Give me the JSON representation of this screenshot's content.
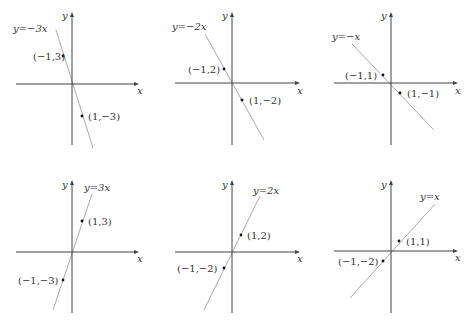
{
  "chart_data": [
    {
      "type": "line",
      "title": "y=-3x",
      "equation": "y=−3x",
      "slope": -3,
      "xlabel": "x",
      "ylabel": "y",
      "points": [
        {
          "x": -1,
          "y": 3,
          "label": "(−1,3)"
        },
        {
          "x": 1,
          "y": -3,
          "label": "(1,−3)"
        }
      ],
      "grid": false
    },
    {
      "type": "line",
      "title": "y=-2x",
      "equation": "y=−2x",
      "slope": -2,
      "xlabel": "x",
      "ylabel": "y",
      "points": [
        {
          "x": -1,
          "y": 2,
          "label": "(−1,2)"
        },
        {
          "x": 1,
          "y": -2,
          "label": "(1,−2)"
        }
      ],
      "grid": false
    },
    {
      "type": "line",
      "title": "y=-x",
      "equation": "y=−x",
      "slope": -1,
      "xlabel": "x",
      "ylabel": "y",
      "points": [
        {
          "x": -1,
          "y": 1,
          "label": "(−1,1)"
        },
        {
          "x": 1,
          "y": -1,
          "label": "(1,−1)"
        }
      ],
      "grid": false
    },
    {
      "type": "line",
      "title": "y=3x",
      "equation": "y=3x",
      "slope": 3,
      "xlabel": "x",
      "ylabel": "y",
      "points": [
        {
          "x": 1,
          "y": 3,
          "label": "(1,3)"
        },
        {
          "x": -1,
          "y": -3,
          "label": "(−1,−3)"
        }
      ],
      "grid": false
    },
    {
      "type": "line",
      "title": "y=2x",
      "equation": "y=2x",
      "slope": 2,
      "xlabel": "x",
      "ylabel": "y",
      "points": [
        {
          "x": 1,
          "y": 2,
          "label": "(1,2)"
        },
        {
          "x": -1,
          "y": -2,
          "label": "(−1,−2)"
        }
      ],
      "grid": false
    },
    {
      "type": "line",
      "title": "y=x",
      "equation": "y=x",
      "slope": 1,
      "xlabel": "x",
      "ylabel": "y",
      "points": [
        {
          "x": 1,
          "y": 1,
          "label": "(1,1)"
        },
        {
          "x": -1,
          "y": -2,
          "label": "(−1,−2)"
        }
      ],
      "grid": false
    }
  ],
  "layout": [
    {
      "ox": 72,
      "oy": 84,
      "xmin": 16,
      "xmax": 139,
      "ymin": 12,
      "ymax": 145,
      "line": [
        [
          56,
          30
        ],
        [
          93,
          148
        ]
      ],
      "eq_pos": [
        13,
        32
      ],
      "ylbl_pos": [
        62,
        19
      ],
      "xlbl_pos": [
        137,
        94
      ],
      "pts": [
        [
          63,
          56,
          33,
          60
        ],
        [
          82,
          116,
          88,
          120
        ]
      ]
    },
    {
      "ox": 232,
      "oy": 83,
      "xmin": 175,
      "xmax": 300,
      "ymin": 12,
      "ymax": 145,
      "line": [
        [
          205,
          34
        ],
        [
          264,
          140
        ]
      ],
      "eq_pos": [
        172,
        30
      ],
      "ylbl_pos": [
        222,
        19
      ],
      "xlbl_pos": [
        297,
        94
      ],
      "pts": [
        [
          224,
          69,
          188,
          73
        ],
        [
          242,
          100,
          249,
          104
        ]
      ]
    },
    {
      "ox": 391,
      "oy": 83,
      "xmin": 334,
      "xmax": 458,
      "ymin": 12,
      "ymax": 145,
      "line": [
        [
          352,
          44
        ],
        [
          434,
          130
        ]
      ],
      "eq_pos": [
        332,
        40
      ],
      "ylbl_pos": [
        381,
        19
      ],
      "xlbl_pos": [
        455,
        94
      ],
      "pts": [
        [
          383,
          75,
          345,
          79
        ],
        [
          400,
          93,
          407,
          97
        ]
      ]
    },
    {
      "ox": 72,
      "oy": 252,
      "xmin": 16,
      "xmax": 139,
      "ymin": 180,
      "ymax": 313,
      "line": [
        [
          53,
          310
        ],
        [
          92,
          194
        ]
      ],
      "eq_pos": [
        84,
        191
      ],
      "ylbl_pos": [
        62,
        188
      ],
      "xlbl_pos": [
        137,
        262
      ],
      "pts": [
        [
          82,
          221,
          88,
          225
        ],
        [
          63,
          280,
          18,
          284
        ]
      ]
    },
    {
      "ox": 232,
      "oy": 252,
      "xmin": 175,
      "xmax": 300,
      "ymin": 180,
      "ymax": 313,
      "line": [
        [
          204,
          310
        ],
        [
          260,
          196
        ]
      ],
      "eq_pos": [
        253,
        194
      ],
      "ylbl_pos": [
        222,
        188
      ],
      "xlbl_pos": [
        297,
        262
      ],
      "pts": [
        [
          241,
          235,
          247,
          239
        ],
        [
          224,
          268,
          177,
          272
        ]
      ]
    },
    {
      "ox": 391,
      "oy": 251,
      "xmin": 334,
      "xmax": 458,
      "ymin": 180,
      "ymax": 313,
      "line": [
        [
          350,
          298
        ],
        [
          435,
          204
        ]
      ],
      "eq_pos": [
        420,
        200
      ],
      "ylbl_pos": [
        381,
        188
      ],
      "xlbl_pos": [
        455,
        261
      ],
      "pts": [
        [
          399,
          241,
          406,
          245
        ],
        [
          383,
          261,
          338,
          265
        ]
      ]
    }
  ]
}
